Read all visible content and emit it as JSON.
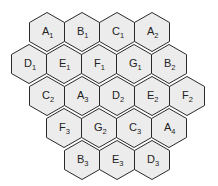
{
  "diagram": {
    "type": "hexagonal cell grid",
    "colors": {
      "fill": "#ececec",
      "stroke": "#2a2a2a",
      "text": "#222222"
    },
    "rows": [
      {
        "cells": [
          {
            "letter": "A",
            "sub": "1"
          },
          {
            "letter": "B",
            "sub": "1"
          },
          {
            "letter": "C",
            "sub": "1"
          },
          {
            "letter": "A",
            "sub": "2"
          }
        ]
      },
      {
        "cells": [
          {
            "letter": "D",
            "sub": "1"
          },
          {
            "letter": "E",
            "sub": "1"
          },
          {
            "letter": "F",
            "sub": "1"
          },
          {
            "letter": "G",
            "sub": "1"
          },
          {
            "letter": "B",
            "sub": "2"
          }
        ]
      },
      {
        "cells": [
          {
            "letter": "C",
            "sub": "2"
          },
          {
            "letter": "A",
            "sub": "3"
          },
          {
            "letter": "D",
            "sub": "2"
          },
          {
            "letter": "E",
            "sub": "2"
          },
          {
            "letter": "F",
            "sub": "2"
          }
        ]
      },
      {
        "cells": [
          {
            "letter": "F",
            "sub": "3"
          },
          {
            "letter": "G",
            "sub": "2"
          },
          {
            "letter": "C",
            "sub": "3"
          },
          {
            "letter": "A",
            "sub": "4"
          }
        ]
      },
      {
        "cells": [
          {
            "letter": "B",
            "sub": "3"
          },
          {
            "letter": "E",
            "sub": "3"
          },
          {
            "letter": "D",
            "sub": "3"
          }
        ]
      }
    ]
  }
}
